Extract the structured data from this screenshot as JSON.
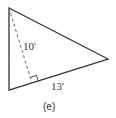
{
  "figure": {
    "caption": "(e)",
    "shape": "triangle",
    "vertices": {
      "top": [
        9,
        8
      ],
      "bottom_left": [
        9,
        90
      ],
      "right": [
        108,
        59
      ]
    },
    "altitude": {
      "from": [
        9,
        8
      ],
      "foot": [
        32,
        83
      ],
      "style": "dashed",
      "label": "10'"
    },
    "base": {
      "label": "13'"
    },
    "right_angle_marker": true,
    "colors": {
      "stroke": "#333333",
      "dashed": "#666666",
      "background": "#ffffff"
    }
  }
}
